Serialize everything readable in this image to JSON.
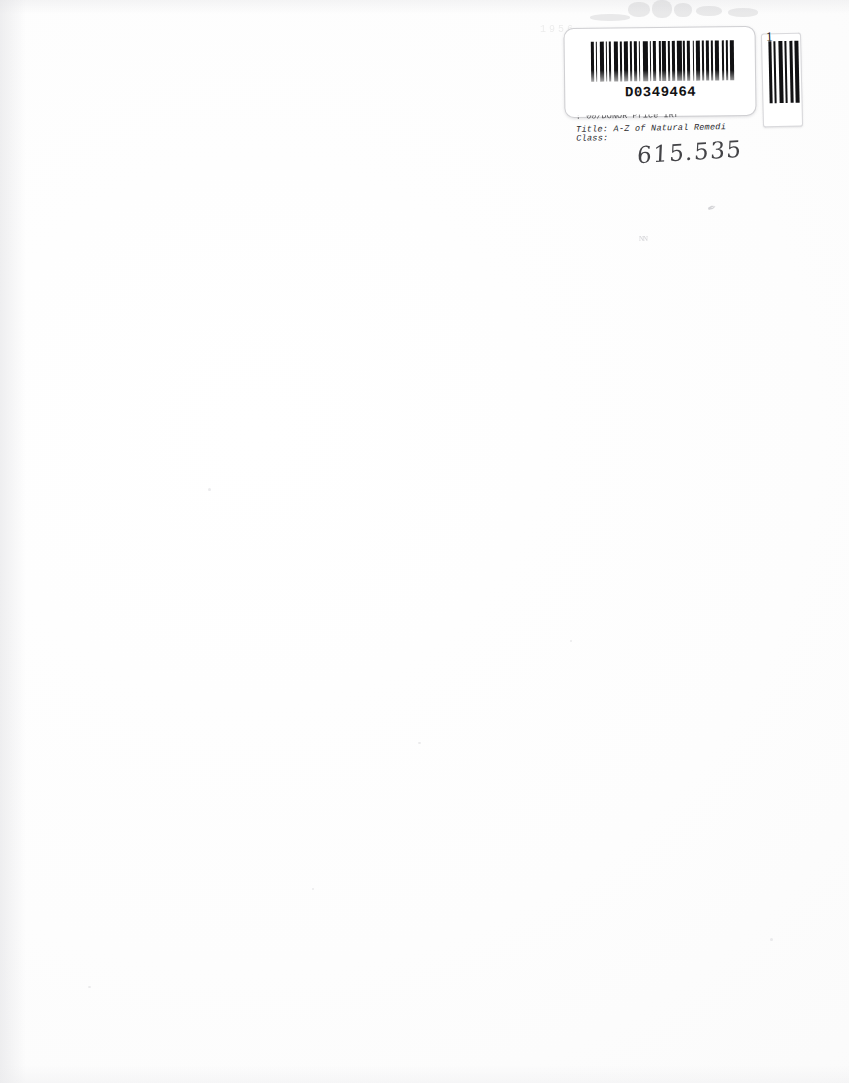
{
  "document": {
    "type": "scanned-book-page",
    "description": "Blank endpaper of a scanned book showing a library circulation barcode label in the upper-right corner",
    "page_background": "#fefefe",
    "ink_color": "#2b2b2e"
  },
  "label": {
    "barcode_number": "D0349464",
    "copy_number": "1",
    "lines": [
      {
        "key": "supplier",
        "text": ": 00/DONOR Price IRf",
        "clipped": true
      },
      {
        "key": "title",
        "label": "Title:",
        "value": "A-Z of Natural Remedi",
        "text": "Title: A-Z of Natural Remedi",
        "clipped": true
      },
      {
        "key": "class",
        "label": "Class:",
        "value": "",
        "text": "Class:",
        "clipped": false
      }
    ],
    "handwritten_class_mark": "615.535",
    "barcode_symbology": "code-39"
  },
  "artifacts": {
    "mark_1": "✒",
    "mark_2": "ɴɴ",
    "ghost_text": "1956"
  }
}
